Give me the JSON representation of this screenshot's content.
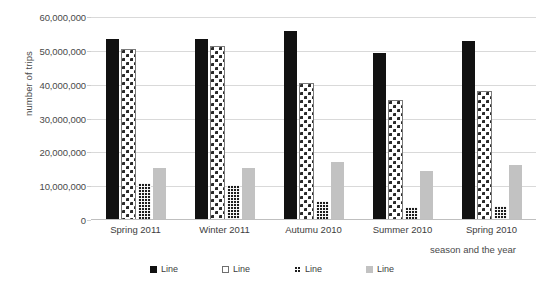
{
  "chart_data": {
    "type": "bar",
    "title": "",
    "xlabel": "season and the year",
    "ylabel": "number of trips",
    "categories": [
      "Spring 2011",
      "Winter 2011",
      "Autumu 2010",
      "Summer 2010",
      "Spring 2010"
    ],
    "series": [
      {
        "name": "Line",
        "values": [
          53500000,
          53500000,
          56000000,
          49500000,
          53000000
        ]
      },
      {
        "name": "Line",
        "values": [
          50000000,
          50800000,
          40000000,
          35000000,
          37500000
        ]
      },
      {
        "name": "Line",
        "values": [
          11000000,
          10300000,
          5500000,
          3700000,
          4200000
        ]
      },
      {
        "name": "Line",
        "values": [
          15500000,
          15300000,
          17200000,
          14600000,
          16300000
        ]
      }
    ],
    "ylim": [
      0,
      60000000
    ],
    "yticks": [
      0,
      10000000,
      20000000,
      30000000,
      40000000,
      50000000,
      60000000
    ],
    "ytick_labels": [
      "0",
      "10,000,000",
      "20,000,000",
      "30,000,000",
      "40,000,000",
      "50,000,000",
      "60,000,000"
    ],
    "grid": true,
    "legend_position": "bottom",
    "colors": {
      "series_1": "#111111",
      "series_2": "#ffffff",
      "series_3": "#1d1d1d",
      "series_4": "#c2c2c2",
      "gridline": "#d9d9d9",
      "text": "#3d3d3d",
      "background": "#ffffff"
    }
  }
}
